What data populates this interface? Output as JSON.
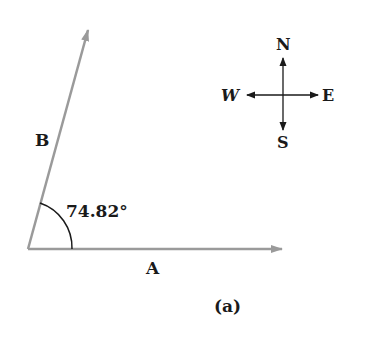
{
  "diagram": {
    "vectors": [
      {
        "name": "A",
        "label": "A",
        "color": "#9a9a9a"
      },
      {
        "name": "B",
        "label": "B",
        "color": "#9a9a9a"
      }
    ],
    "angle_label": "74.82°",
    "caption": "(a)",
    "compass": {
      "north": "N",
      "south": "S",
      "east": "E",
      "west": "W"
    }
  }
}
